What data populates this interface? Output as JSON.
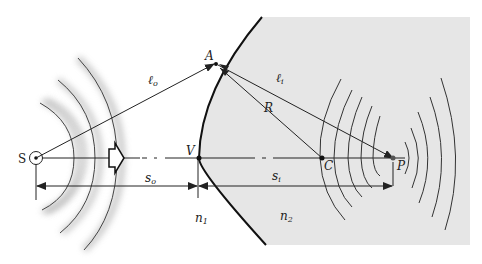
{
  "diagram": {
    "type": "refraction at spherical convex surface",
    "colors": {
      "medium2_fill": "#e6e6e6",
      "line": "#222222",
      "wave": "#333333"
    },
    "points": {
      "S": {
        "label": "S",
        "x": 36,
        "y": 158
      },
      "V": {
        "label": "V",
        "x": 199,
        "y": 158
      },
      "A": {
        "label": "A",
        "x": 216,
        "y": 64
      },
      "C": {
        "label": "C",
        "x": 322,
        "y": 158
      },
      "P": {
        "label": "P",
        "x": 393,
        "y": 158
      }
    },
    "segments": {
      "lo": {
        "label": "ℓ",
        "sub": "o"
      },
      "li": {
        "label": "ℓ",
        "sub": "i"
      },
      "R": {
        "label": "R"
      }
    },
    "dimensions": {
      "so": {
        "label": "s",
        "sub": "o"
      },
      "si": {
        "label": "s",
        "sub": "i"
      }
    },
    "media": {
      "n1": {
        "label": "n",
        "sub": "1"
      },
      "n2": {
        "label": "n",
        "sub": "2"
      }
    },
    "propagation_arrow": "hollow-right-arrow"
  }
}
